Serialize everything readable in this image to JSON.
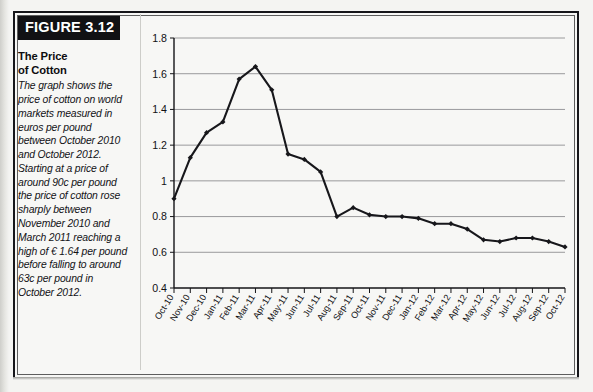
{
  "figure": {
    "tag": "FIGURE 3.12",
    "title_line1": "The Price",
    "title_line2": "of Cotton",
    "caption": "The graph shows the price of cotton on world markets measured in euros per pound between October 2010 and October 2012. Starting at a price of around 90c per pound the price of cotton rose sharply between November 2010 and March 2011 reaching a high of € 1.64 per pound before falling to around 63c per pound in October 2012."
  },
  "chart_data": {
    "type": "line",
    "title": "The Price of Cotton",
    "xlabel": "",
    "ylabel": "",
    "ylim": [
      0.4,
      1.8
    ],
    "ytick_step": 0.2,
    "grid": true,
    "legend": "none",
    "units": "euros per pound",
    "ytick_labels": [
      "1.8",
      "1.6",
      "1.4",
      "1.2",
      "1",
      "0.8",
      "0.6",
      "0.4"
    ],
    "categories": [
      "Oct-10",
      "Nov-10",
      "Dec-10",
      "Jan-11",
      "Feb-11",
      "Mar-11",
      "Apr-11",
      "May-11",
      "Jun-11",
      "Jul-11",
      "Aug-11",
      "Sep-11",
      "Oct-11",
      "Nov-11",
      "Dec-11",
      "Jan-12",
      "Feb-12",
      "Mar-12",
      "Apr-12",
      "May-12",
      "Jun-12",
      "Jul-12",
      "Aug-12",
      "Sep-12",
      "Oct-12"
    ],
    "values": [
      0.9,
      1.13,
      1.27,
      1.33,
      1.57,
      1.64,
      1.51,
      1.15,
      1.12,
      1.05,
      0.8,
      0.85,
      0.81,
      0.8,
      0.8,
      0.79,
      0.76,
      0.76,
      0.73,
      0.67,
      0.66,
      0.68,
      0.68,
      0.66,
      0.63
    ],
    "annotations": {
      "high": "€ 1.64 per pound",
      "start": "around 90c per pound",
      "end": "around 63c per pound"
    }
  }
}
